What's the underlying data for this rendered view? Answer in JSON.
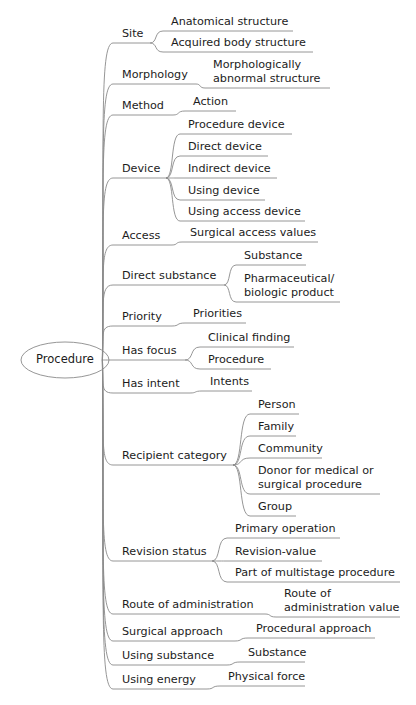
{
  "root": {
    "label": "Procedure",
    "cx": 65,
    "cy": 360,
    "rx": 44,
    "ry": 18
  },
  "colors": {
    "line": "#8a8a8a",
    "text": "#1c1c1c",
    "background": "#ffffff"
  },
  "branches": [
    {
      "label": "Site",
      "x": 122,
      "y": 43,
      "end": 150,
      "children": [
        {
          "label": "Anatomical structure",
          "lines": 1,
          "y": 31,
          "x0": 163,
          "x1": 293
        },
        {
          "label": "Acquired body structure",
          "lines": 1,
          "y": 52,
          "x0": 163,
          "x1": 313
        }
      ]
    },
    {
      "label": "Morphology",
      "x": 122,
      "y": 84,
      "end": 196,
      "children": [
        {
          "label": "Morphologically\nabnormal structure",
          "lines": 2,
          "y": 88,
          "x0": 205,
          "x1": 330
        }
      ]
    },
    {
      "label": "Method",
      "x": 122,
      "y": 115,
      "end": 173,
      "children": [
        {
          "label": "Action",
          "lines": 1,
          "y": 111,
          "x0": 185,
          "x1": 236
        }
      ]
    },
    {
      "label": "Device",
      "x": 122,
      "y": 178,
      "end": 166,
      "children": [
        {
          "label": "Procedure device",
          "lines": 1,
          "y": 134,
          "x0": 180,
          "x1": 292
        },
        {
          "label": "Direct device",
          "lines": 1,
          "y": 156,
          "x0": 180,
          "x1": 268
        },
        {
          "label": "Indirect device",
          "lines": 1,
          "y": 178,
          "x0": 180,
          "x1": 277
        },
        {
          "label": "Using device",
          "lines": 1,
          "y": 200,
          "x0": 180,
          "x1": 265
        },
        {
          "label": "Using access device",
          "lines": 1,
          "y": 221,
          "x0": 180,
          "x1": 305
        }
      ]
    },
    {
      "label": "Access",
      "x": 122,
      "y": 245,
      "end": 172,
      "children": [
        {
          "label": "Surgical access values",
          "lines": 1,
          "y": 242,
          "x0": 182,
          "x1": 318
        }
      ]
    },
    {
      "label": "Direct substance",
      "x": 122,
      "y": 285,
      "end": 224,
      "children": [
        {
          "label": "Substance",
          "lines": 1,
          "y": 265,
          "x0": 236,
          "x1": 306
        },
        {
          "label": "Pharmaceutical/\nbiologic product",
          "lines": 2,
          "y": 302,
          "x0": 236,
          "x1": 340
        }
      ]
    },
    {
      "label": "Priority",
      "x": 122,
      "y": 326,
      "end": 172,
      "children": [
        {
          "label": "Priorities",
          "lines": 1,
          "y": 323,
          "x0": 185,
          "x1": 246
        }
      ]
    },
    {
      "label": "Has focus",
      "x": 122,
      "y": 360,
      "end": 185,
      "children": [
        {
          "label": "Clinical finding",
          "lines": 1,
          "y": 347,
          "x0": 200,
          "x1": 294
        },
        {
          "label": "Procedure",
          "lines": 1,
          "y": 369,
          "x0": 200,
          "x1": 271
        }
      ]
    },
    {
      "label": "Has intent",
      "x": 122,
      "y": 393,
      "end": 190,
      "children": [
        {
          "label": "Intents",
          "lines": 1,
          "y": 391,
          "x0": 202,
          "x1": 252
        }
      ]
    },
    {
      "label": "Recipient category",
      "x": 122,
      "y": 465,
      "end": 233,
      "children": [
        {
          "label": "Person",
          "lines": 1,
          "y": 414,
          "x0": 250,
          "x1": 299
        },
        {
          "label": "Family",
          "lines": 1,
          "y": 436,
          "x0": 250,
          "x1": 296
        },
        {
          "label": "Community",
          "lines": 1,
          "y": 458,
          "x0": 250,
          "x1": 322
        },
        {
          "label": "Donor for medical or\nsurgical procedure",
          "lines": 2,
          "y": 494,
          "x0": 250,
          "x1": 380
        },
        {
          "label": "Group",
          "lines": 1,
          "y": 516,
          "x0": 250,
          "x1": 296
        }
      ]
    },
    {
      "label": "Revision status",
      "x": 122,
      "y": 561,
      "end": 212,
      "children": [
        {
          "label": "Primary operation",
          "lines": 1,
          "y": 538,
          "x0": 227,
          "x1": 340
        },
        {
          "label": "Revision-value",
          "lines": 1,
          "y": 561,
          "x0": 227,
          "x1": 322
        },
        {
          "label": "Part of multistage procedure",
          "lines": 1,
          "y": 582,
          "x0": 227,
          "x1": 400
        }
      ]
    },
    {
      "label": "Route of administration",
      "x": 122,
      "y": 614,
      "end": 265,
      "children": [
        {
          "label": "Route of\nadministration value",
          "lines": 2,
          "y": 617,
          "x0": 276,
          "x1": 400
        }
      ]
    },
    {
      "label": "Surgical approach",
      "x": 122,
      "y": 641,
      "end": 235,
      "children": [
        {
          "label": "Procedural approach",
          "lines": 1,
          "y": 638,
          "x0": 248,
          "x1": 375
        }
      ]
    },
    {
      "label": "Using substance",
      "x": 122,
      "y": 665,
      "end": 227,
      "children": [
        {
          "label": "Substance",
          "lines": 1,
          "y": 662,
          "x0": 240,
          "x1": 305
        }
      ]
    },
    {
      "label": "Using energy",
      "x": 122,
      "y": 689,
      "end": 207,
      "children": [
        {
          "label": "Physical force",
          "lines": 1,
          "y": 686,
          "x0": 220,
          "x1": 305
        }
      ]
    }
  ]
}
